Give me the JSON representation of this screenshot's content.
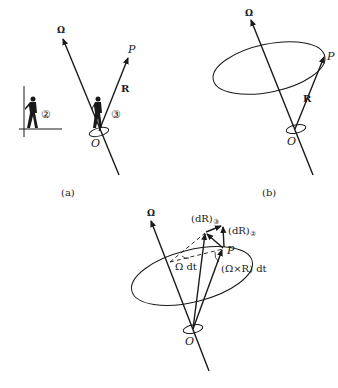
{
  "figures": {
    "a": {
      "caption": "(a)",
      "omega_label": "Ω",
      "point_label": "P",
      "vector_label": "R",
      "origin_label": "O",
      "observer_rotating": "③",
      "observer_fixed": "②"
    },
    "b": {
      "caption": "(b)",
      "omega_label": "Ω",
      "point_label": "P",
      "vector_label": "R",
      "origin_label": "O"
    },
    "c": {
      "omega_label": "Ω",
      "point_label": "P",
      "origin_label": "O",
      "dR_rotating": "(dR)",
      "dR_rotating_sub": "③",
      "dR_fixed": "(dR)",
      "dR_fixed_sub": "②",
      "angle_label": "Ω dt",
      "cross_label": "(Ω×R) dt"
    }
  },
  "colors": {
    "ink": "#1a1a1a",
    "background": "#ffffff"
  }
}
